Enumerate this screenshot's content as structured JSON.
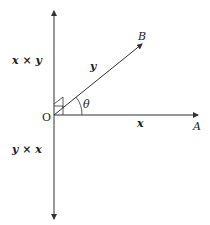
{
  "diagram": {
    "labels": {
      "upper_product": "x × y",
      "lower_product": "y × x",
      "vector_b_name": "y",
      "vector_a_name": "x",
      "point_b": "B",
      "point_a": "A",
      "origin": "O",
      "angle": "θ"
    },
    "colors": {
      "line": "#333333",
      "background": "#ffffff"
    }
  }
}
